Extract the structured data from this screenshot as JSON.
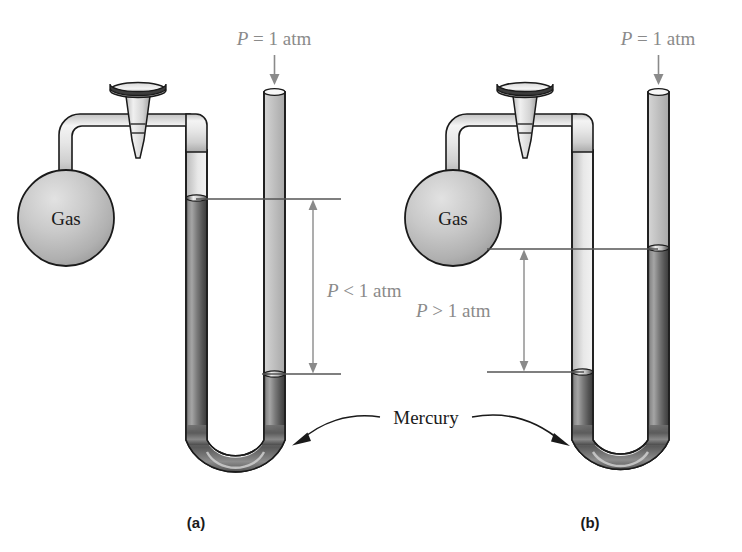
{
  "figure": {
    "title": "",
    "type": "manometer-diagram",
    "panels": [
      {
        "id": "a",
        "panel_label": "(a)",
        "bulb_label": "Gas",
        "atm_label": "P = 1 atm",
        "pressure_label": "P < 1 atm",
        "pressure_label_parts": {
          "symbol": "P",
          "relation": "<",
          "value": "1 atm"
        },
        "description": "closed-arm mercury level higher than open-arm level"
      },
      {
        "id": "b",
        "panel_label": "(b)",
        "bulb_label": "Gas",
        "atm_label": "P = 1 atm",
        "pressure_label": "P > 1 atm",
        "pressure_label_parts": {
          "symbol": "P",
          "relation": ">",
          "value": "1 atm"
        },
        "description": "open-arm mercury level higher than closed-arm level"
      }
    ],
    "shared": {
      "mercury_label": "Mercury"
    },
    "colors": {
      "mercury": "#6b6b6b",
      "mercury_dark": "#3f3f3f",
      "glass_light": "#f2f2f2",
      "glass_mid": "#d7d7d7",
      "outline": "#1a1a1a",
      "label_gray": "#8a8a8a",
      "label_black": "#1a1a1a",
      "background": "#ffffff"
    }
  }
}
